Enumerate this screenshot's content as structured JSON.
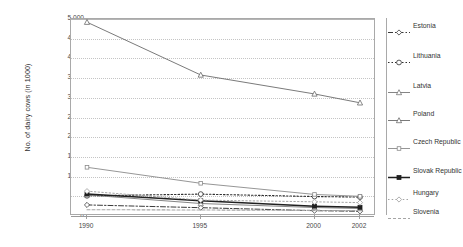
{
  "chart": {
    "type": "line",
    "ylabel": "No. of dairy cows (in 1000)",
    "xlabel": "",
    "title": ""
  },
  "axis": {
    "y_ticks": [
      "5,000",
      "4,500",
      "4,000",
      "3,500",
      "3,000",
      "2,500",
      "2,000",
      "1,500",
      "1,000",
      "500",
      "0"
    ],
    "x_ticks": [
      "1990",
      "1995",
      "2000",
      "2002"
    ]
  },
  "legend": {
    "items": [
      {
        "label": "Estonia",
        "symbol": "dash-dot-diamond"
      },
      {
        "label": "Lithuania",
        "symbol": "dot-dash-circle"
      },
      {
        "label": "Latvia",
        "symbol": "line-triangle"
      },
      {
        "label": "Poland",
        "symbol": "line-triangle-solid"
      },
      {
        "label": "Czech Republic",
        "symbol": "line-square-small"
      },
      {
        "label": "Slovak Republic",
        "symbol": "line-square-bold"
      },
      {
        "label": "Hungary",
        "symbol": "dot-diamond"
      },
      {
        "label": "Slovenia",
        "symbol": "dashed-line"
      }
    ]
  },
  "chart_data": {
    "type": "line",
    "title": "",
    "xlabel": "",
    "ylabel": "No. of dairy cows (in 1000)",
    "categories": [
      "1990",
      "1995",
      "2000",
      "2002"
    ],
    "x": [
      1990,
      1995,
      2000,
      2002
    ],
    "ylim": [
      0,
      5000
    ],
    "ytick_step": 500,
    "grid": true,
    "legend_position": "right",
    "series": [
      {
        "name": "Estonia",
        "values": [
          281,
          211,
          135,
          120
        ],
        "color": "#3a3a3a"
      },
      {
        "name": "Lithuania",
        "values": [
          512,
          556,
          494,
          480
        ],
        "color": "#2e2e2e"
      },
      {
        "name": "Latvia",
        "values": [
          535,
          317,
          215,
          190
        ],
        "color": "#777777"
      },
      {
        "name": "Poland",
        "values": [
          4919,
          3579,
          3098,
          2873
        ],
        "color": "#6b6b6b"
      },
      {
        "name": "Czech Republic",
        "values": [
          1236,
          830,
          547,
          500
        ],
        "color": "#8a8a8a"
      },
      {
        "name": "Slovak Republic",
        "values": [
          559,
          384,
          250,
          220
        ],
        "color": "#1f1f1f"
      },
      {
        "name": "Hungary",
        "values": [
          630,
          404,
          360,
          340
        ],
        "color": "#9a9a9a"
      },
      {
        "name": "Slovenia",
        "values": [
          160,
          152,
          142,
          138
        ],
        "color": "#a5a5a5"
      }
    ]
  }
}
